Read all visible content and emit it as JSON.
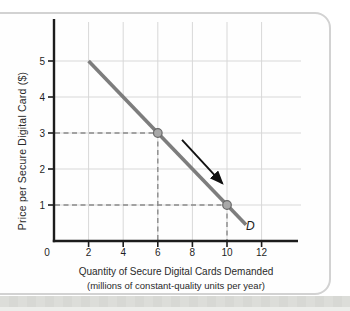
{
  "figure": {
    "page_background": "#ffffff",
    "card_background": "#fefefe",
    "card_border_color": "#d2d2d2",
    "bottom_strip_color": "#dcddd9"
  },
  "chart_data": {
    "type": "line",
    "title": "",
    "xlabel": "Quantity of Secure Digital Cards Demanded",
    "xlabel_sub": "(millions of constant-quality units per year)",
    "ylabel": "Price per Secure Digital Card ($)",
    "xlim": [
      0,
      14.3
    ],
    "ylim": [
      0,
      6.17
    ],
    "x_ticks": [
      0,
      2,
      4,
      6,
      8,
      10,
      12
    ],
    "y_ticks": [
      1,
      2,
      3,
      4,
      5
    ],
    "grid": true,
    "legend": "none",
    "series": [
      {
        "name": "D",
        "points": [
          [
            2,
            5
          ],
          [
            11.1,
            0.45
          ]
        ],
        "color": "#7d7d7d",
        "width": 3.6,
        "label_pos": [
          11.35,
          0.42
        ]
      }
    ],
    "marked_points": [
      {
        "x": 6,
        "y": 3,
        "guides": true
      },
      {
        "x": 10,
        "y": 1,
        "guides": true
      }
    ],
    "annotations": [
      {
        "type": "arrow",
        "from": [
          7.4,
          2.81
        ],
        "to": [
          9.71,
          1.61
        ],
        "color": "#111111"
      }
    ],
    "colors": {
      "grid": "#d8d8d8",
      "axis": "#1c1c1c",
      "dashed_guide": "#8a8a8a",
      "point_fill": "#a8a8a8",
      "point_stroke": "#696969",
      "tick_label": "#1f1f1f"
    }
  }
}
